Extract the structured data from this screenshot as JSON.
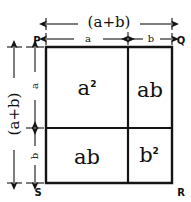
{
  "figure": {
    "kind": "geometry-diagram",
    "stroke_color": "#141414",
    "background_color": "#ffffff"
  },
  "corners": {
    "top_left": "P",
    "top_right": "Q",
    "bottom_right": "R",
    "bottom_left": "S"
  },
  "dimensions": {
    "top_total": "(a+b)",
    "top_segment_left": "a",
    "top_segment_right": "b",
    "left_total": "(a+b)",
    "left_segment_upper": "a",
    "left_segment_lower": "b"
  },
  "cells": [
    {
      "position": "top-left",
      "term": "a",
      "exponent": "2",
      "label": "a²"
    },
    {
      "position": "top-right",
      "term": "ab",
      "exponent": "",
      "label": "ab"
    },
    {
      "position": "bottom-left",
      "term": "ab",
      "exponent": "",
      "label": "ab"
    },
    {
      "position": "bottom-right",
      "term": "b",
      "exponent": "2",
      "label": "b²"
    }
  ]
}
